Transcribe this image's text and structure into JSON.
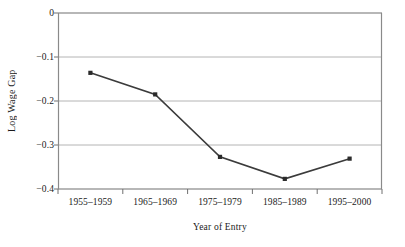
{
  "chart_data": {
    "type": "line",
    "title": "",
    "xlabel": "Year of Entry",
    "ylabel": "Log Wage Gap",
    "categories": [
      "1955–1959",
      "1965–1969",
      "1975–1979",
      "1985–1989",
      "1995–2000"
    ],
    "values": [
      -0.136,
      -0.185,
      -0.327,
      -0.377,
      -0.331
    ],
    "series": [
      {
        "name": "Log Wage Gap",
        "values": [
          -0.136,
          -0.185,
          -0.327,
          -0.377,
          -0.331
        ]
      }
    ],
    "ylim": [
      -0.4,
      0
    ],
    "yticks": [
      0,
      -0.1,
      -0.2,
      -0.3,
      -0.4
    ],
    "ytick_labels": [
      "0",
      "−0.1",
      "−0.2",
      "−0.3",
      "−0.4"
    ],
    "grid": "horizontal",
    "legend": "none",
    "marker": "square-dot",
    "line_color": "#3b3b3b",
    "marker_color": "#2b2b2b",
    "grid_color": "#b0b0b0",
    "axis_color": "#808080",
    "background": "#ffffff"
  },
  "axis": {
    "y_title": "Log Wage Gap",
    "x_title": "Year of Entry"
  }
}
